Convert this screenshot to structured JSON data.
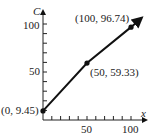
{
  "chart_data": {
    "type": "line",
    "title": "",
    "xlabel": "x",
    "ylabel": "C",
    "x_ticks": [
      "50",
      "100"
    ],
    "y_ticks": [
      "50",
      "100"
    ],
    "xlim": [
      0,
      110
    ],
    "ylim": [
      0,
      110
    ],
    "grid": false,
    "series": [
      {
        "name": "C",
        "x": [
          0,
          50,
          100
        ],
        "y": [
          9.45,
          59.33,
          96.74
        ]
      }
    ],
    "annotations": [
      "(0, 9.45)",
      "(50, 59.33)",
      "(100, 96.74)"
    ]
  }
}
